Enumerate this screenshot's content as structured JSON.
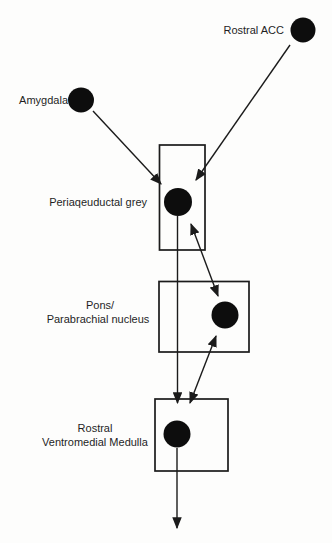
{
  "figure": {
    "type": "pathway-diagram",
    "background_color": "#fdfdfc",
    "ink_color": "#1b1b1b",
    "node_fill_color": "#0d0d0d",
    "nodes": {
      "rostral_acc": {
        "label": "Rostral ACC",
        "shape": "filled-circle"
      },
      "amygdala": {
        "label": "Amygdala",
        "shape": "filled-circle"
      },
      "periaqueductal_grey": {
        "label": "Periaqeuductal grey",
        "shape": "box-with-filled-circle"
      },
      "pons_parabrachial": {
        "label_line1": "Pons/",
        "label_line2": "Parabrachial nucleus",
        "shape": "box-with-filled-circle"
      },
      "rostral_ventromedial_medulla": {
        "label_line1": "Rostral",
        "label_line2": "Ventromedial Medulla",
        "shape": "box-with-filled-circle"
      }
    },
    "edges": [
      {
        "from": "Amygdala",
        "to": "Periaqeuductal grey",
        "direction": "one-way"
      },
      {
        "from": "Rostral ACC",
        "to": "Periaqeuductal grey",
        "direction": "one-way"
      },
      {
        "from": "Periaqeuductal grey",
        "to": "Pons/Parabrachial nucleus",
        "direction": "two-way"
      },
      {
        "from": "Periaqeuductal grey",
        "to": "Rostral Ventromedial Medulla",
        "direction": "one-way"
      },
      {
        "from": "Pons/Parabrachial nucleus",
        "to": "Rostral Ventromedial Medulla",
        "direction": "two-way"
      },
      {
        "from": "Rostral Ventromedial Medulla",
        "to": "downward off-figure",
        "direction": "one-way"
      }
    ]
  }
}
